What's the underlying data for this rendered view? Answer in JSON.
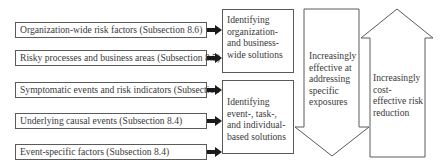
{
  "left_factors": [
    {
      "label": "Organization-wide risk factors (Subsection 8.6)"
    },
    {
      "label": "Risky processes and business areas (Subsection 8.5)"
    },
    {
      "label": "Symptomatic events and risk indicators (Subsection 8.4)"
    },
    {
      "label": "Underlying causal events (Subsection 8.4)"
    },
    {
      "label": "Event-specific factors (Subsection 8.4)"
    }
  ],
  "solutions": [
    {
      "label": "Identifying organization- and business-wide solutions"
    },
    {
      "label": "Identifying event-, task-, and individual-based solutions"
    }
  ],
  "down_arrow": {
    "label": "Increasingly effective at addressing specific exposures"
  },
  "up_arrow": {
    "label": "Increasingly cost-effective risk reduction"
  },
  "colors": {
    "stroke": "#5a5a5a",
    "text": "#3a3a3a",
    "arrow_fill": "#1a1a1a"
  }
}
